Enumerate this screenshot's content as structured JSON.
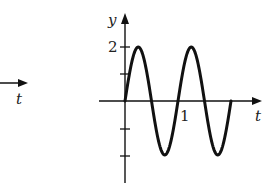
{
  "chart_data": {
    "type": "line",
    "title": "",
    "xlabel": "t",
    "ylabel": "y",
    "function": "y = 2 sin(2πt)",
    "x": [
      0,
      0.125,
      0.25,
      0.375,
      0.5,
      0.625,
      0.75,
      0.875,
      1.0,
      1.125,
      1.25,
      1.375,
      1.5,
      1.625,
      1.75,
      1.875,
      2.0
    ],
    "series": [
      {
        "name": "y(t)",
        "values": [
          0,
          1.41,
          2,
          1.41,
          0,
          -1.41,
          -2,
          -1.41,
          0,
          1.41,
          2,
          1.41,
          0,
          -1.41,
          -2,
          -1.41,
          0
        ]
      }
    ],
    "x_ticks": [
      {
        "value": 1,
        "label": "1"
      }
    ],
    "y_ticks": [
      {
        "value": 2,
        "label": "2"
      },
      {
        "value": 1,
        "label": ""
      },
      {
        "value": -1,
        "label": ""
      },
      {
        "value": -2,
        "label": ""
      }
    ],
    "xlim": [
      -0.5,
      2.5
    ],
    "ylim": [
      -2.5,
      2.7
    ],
    "grid": false,
    "legend": null
  },
  "left_fragment": {
    "axis_label": "t"
  },
  "axes": {
    "x_label": "t",
    "y_label": "y",
    "tick_label_x": "1",
    "tick_label_y": "2"
  }
}
